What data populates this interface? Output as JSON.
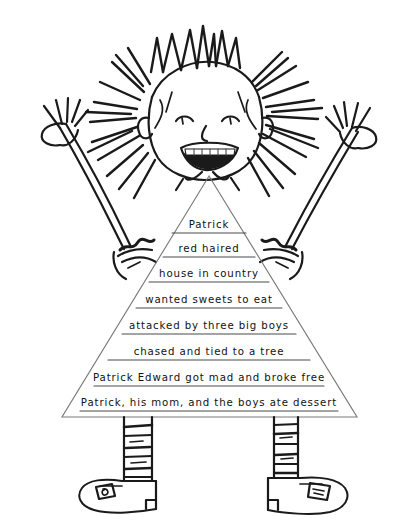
{
  "artwork": {
    "title": "Patrick Edward character story pyramid drawing",
    "medium": "hand-drawn black ink line drawing on white paper",
    "background_color": "#ffffff",
    "ink_color": "#1a1a1a",
    "triangle_outline_color": "#7a7a7a",
    "rule_line_color": "#4a4a4a"
  },
  "story_pyramid": {
    "shape": "triangle",
    "apex": {
      "x": 209,
      "y": 176
    },
    "base_left": {
      "x": 62,
      "y": 417
    },
    "base_right": {
      "x": 357,
      "y": 417
    },
    "lines": [
      {
        "index": 1,
        "text": "Patrick",
        "y": 228
      },
      {
        "index": 2,
        "text": "red haired",
        "y": 252
      },
      {
        "index": 3,
        "text": "house in country",
        "y": 277
      },
      {
        "index": 4,
        "text": "wanted sweets to eat",
        "y": 303
      },
      {
        "index": 5,
        "text": "attacked by three big boys",
        "y": 329
      },
      {
        "index": 6,
        "text": "chased and tied to a tree",
        "y": 355
      },
      {
        "index": 7,
        "text": "Patrick Edward got mad and broke free",
        "y": 381
      },
      {
        "index": 8,
        "text": "Patrick, his mom, and the boys ate dessert",
        "y": 406
      }
    ]
  },
  "figure": {
    "parts": [
      {
        "name": "head",
        "label": "round smiling face"
      },
      {
        "name": "hair",
        "label": "spiky radiating hair"
      },
      {
        "name": "eyes",
        "label": "two eyes"
      },
      {
        "name": "nose",
        "label": "nose"
      },
      {
        "name": "mouth",
        "label": "open smiling mouth with teeth"
      },
      {
        "name": "ears",
        "label": "two ears"
      },
      {
        "name": "left-arm",
        "label": "left arm raised with open hand"
      },
      {
        "name": "right-arm",
        "label": "right arm raised with open hand"
      },
      {
        "name": "left-leg",
        "label": "left striped sock leg"
      },
      {
        "name": "right-leg",
        "label": "right striped sock leg"
      },
      {
        "name": "left-shoe",
        "label": "left shoe with square logo"
      },
      {
        "name": "right-shoe",
        "label": "right shoe with square logo"
      }
    ]
  }
}
